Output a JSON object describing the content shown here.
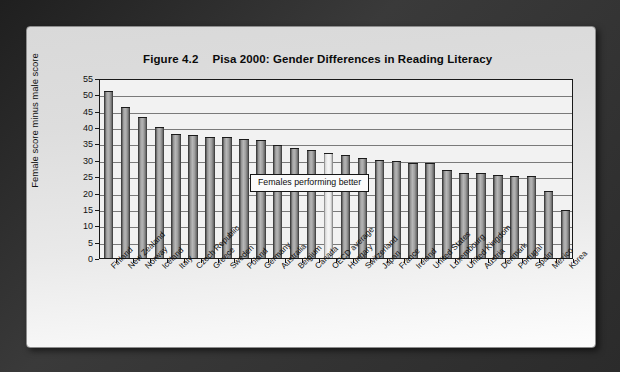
{
  "figure": {
    "number": "Figure 4.2",
    "title": "Pisa 2000: Gender Differences in Reading Literacy"
  },
  "annotation": {
    "text": "Females performing better"
  },
  "chart_data": {
    "type": "bar",
    "title": "Pisa 2000: Gender Differences in Reading Literacy",
    "xlabel": "",
    "ylabel": "Female score minus male score",
    "ylim": [
      0,
      55
    ],
    "ytick_step": 5,
    "yticks": [
      0,
      5,
      10,
      15,
      20,
      25,
      30,
      35,
      40,
      45,
      50,
      55
    ],
    "grid": true,
    "legend": "none",
    "annotations": [
      "Females performing better"
    ],
    "categories": [
      "Finland",
      "New Zealand",
      "Norway",
      "Iceland",
      "Italy",
      "Czech Republic",
      "Greece",
      "Sweden",
      "Poland",
      "Germany",
      "Australia",
      "Belgium",
      "Canada",
      "OECD average",
      "Hungary",
      "Switzerland",
      "Japan",
      "France",
      "Ireland",
      "United States",
      "Luxembourg",
      "United Kingdom",
      "Austria",
      "Denmark",
      "Portugal",
      "Spain",
      "Mexico",
      "Korea"
    ],
    "values": [
      51,
      46,
      43,
      40,
      38,
      37.5,
      37,
      37,
      36.5,
      36,
      34.5,
      33.5,
      33,
      32,
      31.5,
      30.5,
      30,
      29.5,
      29,
      29,
      27,
      26,
      26,
      25.5,
      25,
      25,
      20.5,
      14.7
    ],
    "highlight_category": "OECD average",
    "colors": {
      "bar": "#9e9e9e",
      "bar_edge": "#1b1b1b",
      "highlight_bar": "#efefef",
      "plot_background": "#f2f2f2",
      "gridline": "#7a7a7a",
      "card_background": "#e4e4e4",
      "page_background": "#2e2e2e"
    }
  }
}
